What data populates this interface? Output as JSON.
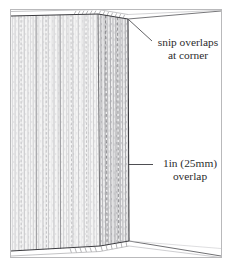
{
  "figure": {
    "background_color": "#ffffff",
    "frame_border_color": "#b9b9bb",
    "ink_color": "#2c2c2e",
    "fabric_fill_color": "#f2f2f2",
    "fabric_line_color": "#8d8d90"
  },
  "annotations": {
    "snip": {
      "line1": "snip overlaps",
      "line2": "at corner"
    },
    "overlap": {
      "line1": "1in (25mm)",
      "line2": "overlap"
    }
  },
  "measurements": {
    "overlap_imperial": "1in",
    "overlap_metric": "25mm"
  }
}
